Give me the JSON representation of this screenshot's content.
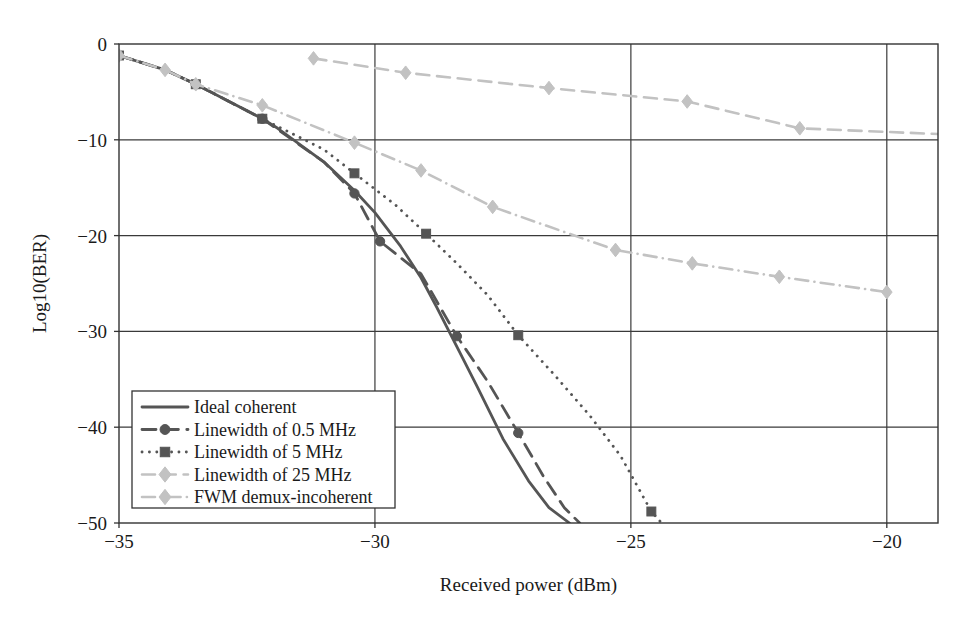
{
  "chart_data": {
    "type": "line",
    "title": "",
    "xlabel": "Received power (dBm)",
    "ylabel": "Log10(BER)",
    "xlim": [
      -35,
      -19
    ],
    "ylim": [
      -50,
      0
    ],
    "xticks": [
      -35,
      -30,
      -25,
      -20
    ],
    "xtick_labels": [
      "−35",
      "−30",
      "−25",
      "−20"
    ],
    "yticks": [
      0,
      -10,
      -20,
      -30,
      -40,
      -50
    ],
    "ytick_labels": [
      "0",
      "−10",
      "−20",
      "−30",
      "−40",
      "−50"
    ],
    "grid": true,
    "legend_position": "lower-left",
    "series": [
      {
        "name": "Ideal coherent",
        "color": "#555555",
        "dash": "solid",
        "marker": "none",
        "x": [
          -35.0,
          -34.1,
          -33.5,
          -32.2,
          -31.9,
          -31.0,
          -30.4,
          -30.0,
          -29.5,
          -29.1,
          -28.8,
          -28.4,
          -28.0,
          -27.5,
          -27.0,
          -26.6,
          -26.2
        ],
        "y": [
          -1.2,
          -2.7,
          -4.2,
          -7.8,
          -8.8,
          -12.3,
          -15.3,
          -17.6,
          -21.1,
          -24.4,
          -27.4,
          -31.6,
          -35.8,
          -41.2,
          -45.6,
          -48.4,
          -50.0
        ]
      },
      {
        "name": "Linewidth of 0.5 MHz",
        "color": "#555555",
        "dash": "dashed",
        "marker": "circle",
        "x": [
          -35.0,
          -34.1,
          -33.5,
          -32.2,
          -31.0,
          -30.4,
          -29.9,
          -29.1,
          -28.4,
          -27.8,
          -27.2,
          -26.7,
          -26.3,
          -26.0
        ],
        "y": [
          -1.2,
          -2.7,
          -4.2,
          -7.8,
          -12.3,
          -15.6,
          -20.6,
          -24.0,
          -30.5,
          -35.2,
          -40.6,
          -45.2,
          -48.4,
          -50.0
        ],
        "marker_x": [
          -35.0,
          -33.5,
          -32.2,
          -30.4,
          -29.9,
          -28.4,
          -27.2
        ],
        "marker_y": [
          -1.2,
          -4.2,
          -7.8,
          -15.6,
          -20.6,
          -30.5,
          -40.6
        ]
      },
      {
        "name": "Linewidth of 5 MHz",
        "color": "#555555",
        "dash": "dotted",
        "marker": "square",
        "x": [
          -35.0,
          -34.1,
          -33.5,
          -32.2,
          -31.6,
          -31.0,
          -30.4,
          -29.6,
          -29.0,
          -28.4,
          -27.8,
          -27.2,
          -26.5,
          -25.8,
          -25.2,
          -24.6,
          -24.4
        ],
        "y": [
          -1.2,
          -2.7,
          -4.2,
          -7.8,
          -9.4,
          -11.0,
          -13.5,
          -16.8,
          -19.8,
          -22.9,
          -26.2,
          -30.4,
          -34.5,
          -38.8,
          -43.0,
          -48.8,
          -50.0
        ],
        "marker_x": [
          -35.0,
          -33.5,
          -32.2,
          -30.4,
          -29.0,
          -27.2,
          -24.6
        ],
        "marker_y": [
          -1.2,
          -4.2,
          -7.8,
          -13.5,
          -19.8,
          -30.4,
          -48.8
        ]
      },
      {
        "name": "Linewidth of 25 MHz",
        "color": "#c2c2c2",
        "dash": "dashed",
        "marker": "diamond",
        "x": [
          -31.2,
          -29.4,
          -26.6,
          -23.9,
          -21.7,
          -19.0
        ],
        "y": [
          -1.5,
          -3.0,
          -4.6,
          -6.0,
          -8.8,
          -9.4
        ],
        "marker_x": [
          -31.2,
          -29.4,
          -26.6,
          -23.9,
          -21.7
        ],
        "marker_y": [
          -1.5,
          -3.0,
          -4.6,
          -6.0,
          -8.8
        ]
      },
      {
        "name": "FWM demux-incoherent",
        "color": "#c2c2c2",
        "dash": "dashdot",
        "marker": "diamond",
        "x": [
          -35.0,
          -34.1,
          -33.5,
          -32.2,
          -30.4,
          -29.1,
          -27.7,
          -25.3,
          -23.8,
          -22.1,
          -20.0
        ],
        "y": [
          -1.2,
          -2.7,
          -4.2,
          -6.4,
          -10.3,
          -13.2,
          -17.0,
          -21.5,
          -22.9,
          -24.3,
          -25.9
        ],
        "marker_x": [
          -35.0,
          -34.1,
          -33.5,
          -32.2,
          -30.4,
          -29.1,
          -27.7,
          -25.3,
          -23.8,
          -22.1,
          -20.0
        ],
        "marker_y": [
          -1.2,
          -2.7,
          -4.2,
          -6.4,
          -10.3,
          -13.2,
          -17.0,
          -21.5,
          -22.9,
          -24.3,
          -25.9
        ]
      }
    ]
  },
  "legend": {
    "entries": [
      {
        "label": "Ideal coherent"
      },
      {
        "label": "Linewidth of 0.5 MHz"
      },
      {
        "label": "Linewidth of 5 MHz"
      },
      {
        "label": "Linewidth of 25 MHz"
      },
      {
        "label": "FWM demux-incoherent"
      }
    ]
  },
  "colors": {
    "dark_series": "#555555",
    "light_series": "#c2c2c2",
    "axis": "#333333",
    "text": "#1a1a1a"
  }
}
